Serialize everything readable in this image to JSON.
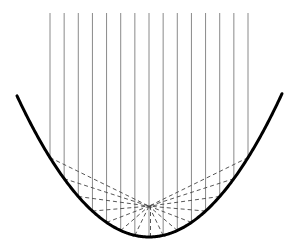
{
  "diagram": {
    "type": "parabolic-reflector",
    "canvas": {
      "width": 293,
      "height": 249
    },
    "parabola": {
      "vertex": {
        "x": 149,
        "y": 237
      },
      "a": 0.0081,
      "x_min": 17,
      "x_max": 282,
      "stroke_color": "#000000",
      "stroke_width": 3
    },
    "incident_rays": {
      "count": 15,
      "x_start": 50,
      "x_end": 248,
      "y_top": 13,
      "stroke_color": "#8a8a8a",
      "stroke_width": 1
    },
    "reflected_rays": {
      "style": "dashed",
      "dash": "4,3",
      "stroke_color": "#444444",
      "stroke_width": 0.9,
      "converge_to": "focus"
    },
    "colors": {
      "background": "#ffffff"
    }
  }
}
